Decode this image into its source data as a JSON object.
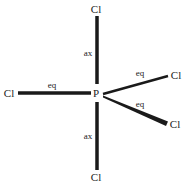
{
  "diagram": {
    "central_atom": {
      "label": "P",
      "x": 96,
      "y": 97
    },
    "atoms": [
      {
        "id": "cl-top",
        "label": "Cl",
        "x": 96,
        "y": 13,
        "type": "ax"
      },
      {
        "id": "cl-bottom",
        "label": "Cl",
        "x": 96,
        "y": 181,
        "type": "ax"
      },
      {
        "id": "cl-left",
        "label": "Cl",
        "x": 9,
        "y": 97,
        "type": "eq"
      },
      {
        "id": "cl-upper-right",
        "label": "Cl",
        "x": 175,
        "y": 79,
        "type": "eq"
      },
      {
        "id": "cl-lower-right",
        "label": "Cl",
        "x": 175,
        "y": 128,
        "type": "eq"
      }
    ],
    "bond_labels": [
      {
        "id": "label-ax-top",
        "text": "ax",
        "x": 88,
        "y": 56
      },
      {
        "id": "label-eq-left",
        "text": "eq",
        "x": 52,
        "y": 88
      },
      {
        "id": "label-eq-upper-right",
        "text": "eq",
        "x": 140,
        "y": 76
      },
      {
        "id": "label-eq-lower-right",
        "text": "eq",
        "x": 140,
        "y": 107
      },
      {
        "id": "label-ax-bottom",
        "text": "ax",
        "x": 88,
        "y": 139
      }
    ],
    "colors": {
      "bond": "#1a1a1a",
      "text": "#222222",
      "background": "#ffffff"
    }
  }
}
